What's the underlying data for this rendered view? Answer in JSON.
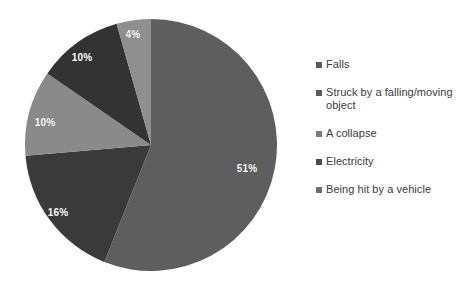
{
  "chart_data": {
    "type": "pie",
    "title": "",
    "labels": [
      "Falls",
      "Struck by a falling/moving object",
      "A collapse",
      "Electricity",
      "Being hit by a vehicle"
    ],
    "values": [
      51,
      16,
      10,
      10,
      4
    ],
    "value_labels": [
      "51%",
      "16%",
      "10%",
      "10%",
      "4%"
    ],
    "colors": [
      "#5e5e5e",
      "#3a3a3a",
      "#8a8a8a",
      "#333333",
      "#8f8f8f"
    ],
    "units": "percent",
    "legend_position": "right",
    "start_angle_deg": 0,
    "direction": "clockwise",
    "data_label_color": "#ffffff",
    "background": "#ffffff"
  },
  "legend": {
    "items": [
      {
        "label": "Falls",
        "color": "#595959"
      },
      {
        "label": "Struck by a falling/moving object",
        "color": "#595959"
      },
      {
        "label": "A collapse",
        "color": "#7d7d7d"
      },
      {
        "label": "Electricity",
        "color": "#4a4a4a"
      },
      {
        "label": "Being hit by a vehicle",
        "color": "#6e6e6e"
      }
    ]
  },
  "slice_labels": [
    {
      "text": "51%",
      "x": 247,
      "y": 168
    },
    {
      "text": "16%",
      "x": 58,
      "y": 212
    },
    {
      "text": "10%",
      "x": 45,
      "y": 122
    },
    {
      "text": "10%",
      "x": 82,
      "y": 57
    },
    {
      "text": "4%",
      "x": 133,
      "y": 34
    }
  ]
}
